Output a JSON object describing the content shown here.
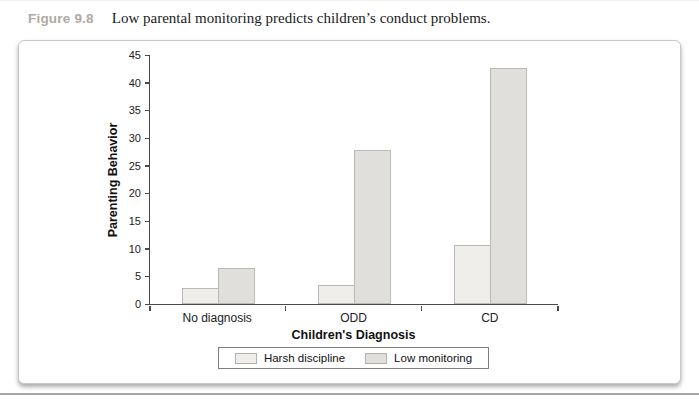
{
  "figure": {
    "label": "Figure 9.8",
    "label_color": "#b2a9a0",
    "caption": "Low parental monitoring predicts children’s conduct problems."
  },
  "chart_data": {
    "type": "bar",
    "categories": [
      "No diagnosis",
      "ODD",
      "CD"
    ],
    "series": [
      {
        "name": "Harsh discipline",
        "values": [
          2.8,
          3.5,
          10.7
        ],
        "color": "#efeeea"
      },
      {
        "name": "Low monitoring",
        "values": [
          6.5,
          27.8,
          42.4
        ],
        "color": "#e0dfdc"
      }
    ],
    "title": "",
    "xlabel": "Children's Diagnosis",
    "ylabel": "Parenting Behavior",
    "ylim": [
      0,
      45
    ],
    "ytick_step": 5,
    "grid": "off",
    "legend_position": "bottom-center"
  }
}
